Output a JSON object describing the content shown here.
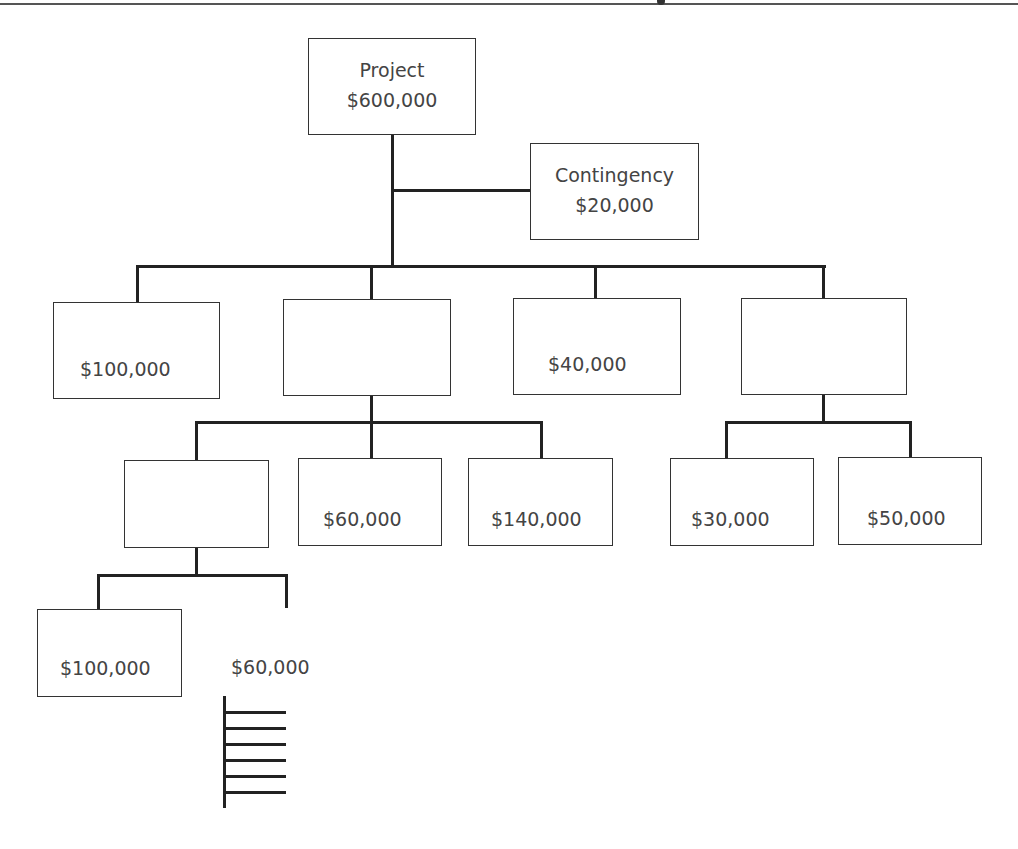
{
  "diagram": {
    "type": "budget-breakdown-tree",
    "root": {
      "label": "Project",
      "amount": "$600,000"
    },
    "contingency": {
      "label": "Contingency",
      "amount": "$20,000"
    },
    "level1": [
      {
        "amount": "$100,000"
      },
      {
        "amount": ""
      },
      {
        "amount": "$40,000"
      },
      {
        "amount": ""
      }
    ],
    "level2_under_box2": [
      {
        "amount": ""
      },
      {
        "amount": "$60,000"
      },
      {
        "amount": "$140,000"
      }
    ],
    "level2_under_box4": [
      {
        "amount": "$30,000"
      },
      {
        "amount": "$50,000"
      }
    ],
    "level3_under_blank": [
      {
        "amount": "$100,000"
      },
      {
        "amount": "$60,000",
        "note": "unboxed, with comb of 6 sub-branches"
      }
    ]
  }
}
